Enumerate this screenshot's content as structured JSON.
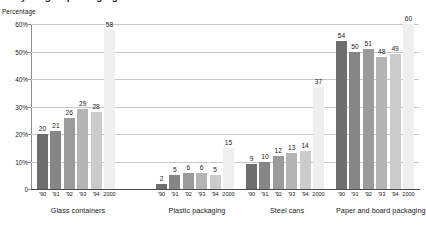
{
  "title_partial": "Recycling of packaging waste",
  "y_axis_label": "Percentage",
  "chart_data": {
    "type": "bar",
    "title": "Recycling of packaging waste",
    "xlabel": "",
    "ylabel": "Percentage",
    "ylim": [
      0,
      60
    ],
    "ytick_labels": [
      "0",
      "10%",
      "20%",
      "30%",
      "40%",
      "50%",
      "60%"
    ],
    "ytick_values": [
      0,
      10,
      20,
      30,
      40,
      50,
      60
    ],
    "grid": true,
    "legend": "none",
    "categories": [
      "'90",
      "'91",
      "'92",
      "'93",
      "'94",
      "2000"
    ],
    "groups": [
      {
        "name": "Glass containers",
        "values": [
          20,
          21,
          26,
          29,
          28,
          58
        ]
      },
      {
        "name": "Plastic packaging",
        "values": [
          2,
          5,
          6,
          6,
          5,
          15
        ]
      },
      {
        "name": "Steel cans",
        "values": [
          9,
          10,
          12,
          13,
          14,
          37
        ]
      },
      {
        "name": "Paper and board packaging",
        "values": [
          54,
          50,
          51,
          48,
          49,
          60
        ]
      }
    ],
    "bar_colors": [
      "#6e6e6e",
      "#868686",
      "#9b9b9b",
      "#b4b4b4",
      "#cccccc",
      "#efefef"
    ],
    "axis_color": "#4a4a4a",
    "grid_color": "#c9c9c9"
  }
}
